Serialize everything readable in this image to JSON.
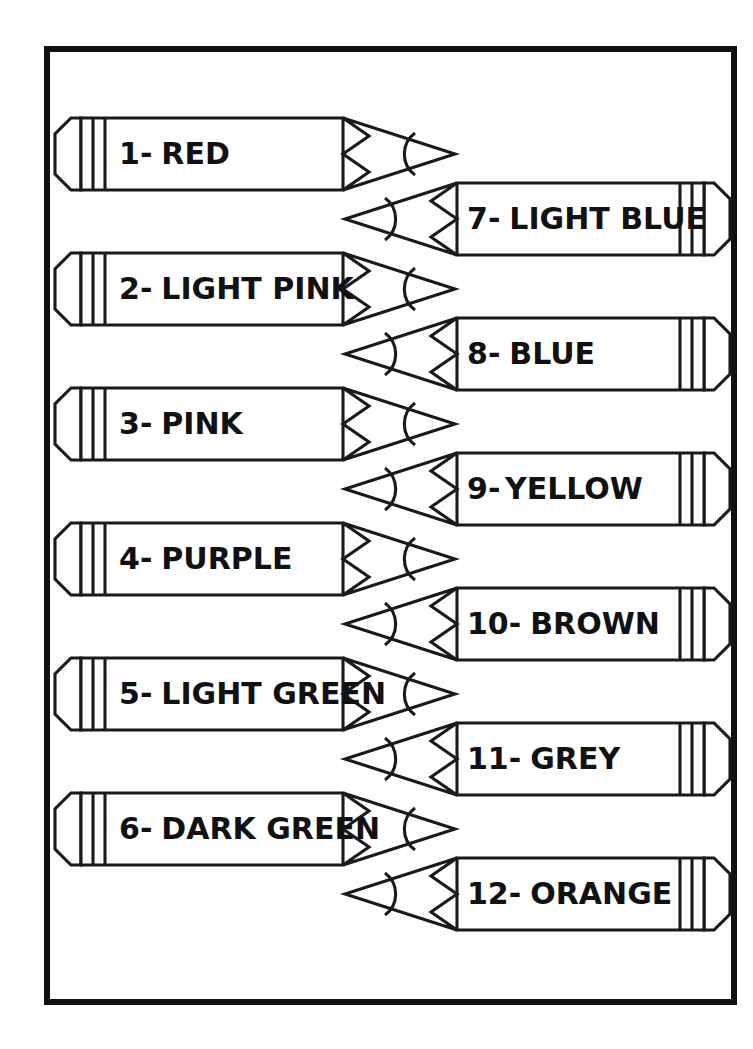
{
  "page": {
    "background_color": "#ffffff",
    "ink_color": "#111111",
    "frame": {
      "name": "worksheet-border",
      "x": 47,
      "y": 49,
      "width": 687,
      "height": 953,
      "stroke_width": 6
    }
  },
  "legend": {
    "separator": "-",
    "orientation_left": "tip-right",
    "orientation_right": "tip-left"
  },
  "pencils": [
    {
      "number": "1",
      "separator": "-",
      "label": "RED",
      "side": "left",
      "row": 0
    },
    {
      "number": "2",
      "separator": "-",
      "label": "LIGHT PINK",
      "side": "left",
      "row": 1
    },
    {
      "number": "3",
      "separator": "-",
      "label": "PINK",
      "side": "left",
      "row": 2
    },
    {
      "number": "4",
      "separator": "-",
      "label": "PURPLE",
      "side": "left",
      "row": 3
    },
    {
      "number": "5",
      "separator": "-",
      "label": "LIGHT GREEN",
      "side": "left",
      "row": 4
    },
    {
      "number": "6",
      "separator": "-",
      "label": "DARK GREEN",
      "side": "left",
      "row": 5
    },
    {
      "number": "7",
      "separator": "-",
      "label": "LIGHT BLUE",
      "side": "right",
      "row": 0
    },
    {
      "number": "8",
      "separator": "-",
      "label": "BLUE",
      "side": "right",
      "row": 1
    },
    {
      "number": "9",
      "separator": "-",
      "label": "YELLOW",
      "side": "right",
      "row": 2
    },
    {
      "number": "10",
      "separator": "-",
      "label": "BROWN",
      "side": "right",
      "row": 3
    },
    {
      "number": "11",
      "separator": "-",
      "label": "GREY",
      "side": "right",
      "row": 4
    },
    {
      "number": "12",
      "separator": "-",
      "label": "ORANGE",
      "side": "right",
      "row": 5
    }
  ],
  "geometry": {
    "left_column": {
      "x": 55,
      "y_first": 118,
      "width": 400,
      "height": 72,
      "row_gap": 135
    },
    "right_column": {
      "x": 345,
      "y_first": 183,
      "width": 385,
      "height": 72,
      "row_gap": 135
    }
  }
}
